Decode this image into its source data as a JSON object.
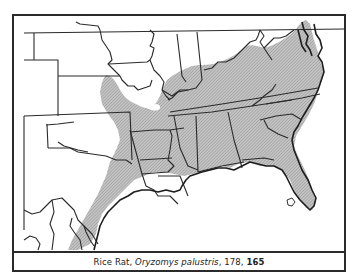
{
  "caption": {
    "common_name": "Rice Rat",
    "sep1": ", ",
    "scientific_name": "Oryzomys palustris",
    "sep2": ", 178, ",
    "page_ref": "178",
    "plate_ref": "165"
  },
  "map": {
    "subject": "Range map of the Rice Rat in the southeastern United States",
    "range_fill_color": "#b8b8b8",
    "line_color": "#2a2a2a",
    "background_color": "#ffffff",
    "range_regions": [
      "Texas Gulf coast",
      "Oklahoma (eastern)",
      "Kansas (southeastern)",
      "Missouri (southern)",
      "Arkansas",
      "Louisiana",
      "Mississippi",
      "Alabama",
      "Georgia",
      "Florida",
      "Tennessee",
      "Kentucky",
      "South Carolina",
      "North Carolina",
      "Virginia",
      "Maryland/Delaware coast",
      "Illinois (southern)"
    ],
    "excluded_spot": "Lake Okeechobee area, Florida"
  }
}
